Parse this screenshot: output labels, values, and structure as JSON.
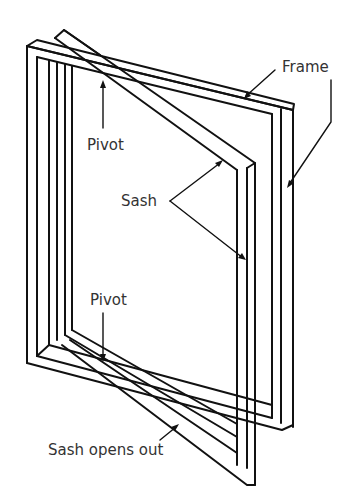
{
  "diagram": {
    "labels": {
      "frame": "Frame",
      "pivot_top": "Pivot",
      "sash": "Sash",
      "pivot_bottom": "Pivot",
      "sash_opens": "Sash opens out"
    },
    "colors": {
      "line": "#111111",
      "text": "#333333",
      "background": "#ffffff"
    }
  }
}
